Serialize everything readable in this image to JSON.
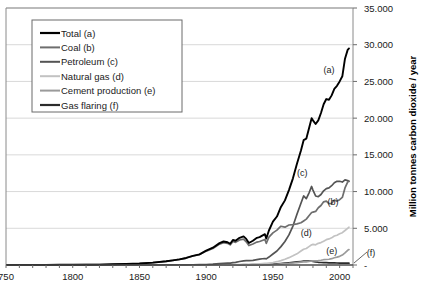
{
  "chart_data": {
    "type": "line",
    "title": "",
    "xlabel": "",
    "ylabel": "Million tonnes carbon dioxide / year",
    "xlim": [
      1750,
      2010
    ],
    "ylim": [
      0,
      35000
    ],
    "grid": true,
    "legend_position": "top-left",
    "x_ticks": [
      "750",
      "1800",
      "1850",
      "1900",
      "1950",
      "2000"
    ],
    "x_tick_values": [
      1750,
      1800,
      1850,
      1900,
      1950,
      2000
    ],
    "y_ticks": [
      "-",
      "5.000",
      "10.000",
      "15.000",
      "20.000",
      "25.000",
      "30.000",
      "35.000"
    ],
    "y_tick_values": [
      0,
      5000,
      10000,
      15000,
      20000,
      25000,
      30000,
      35000
    ],
    "annotations": [
      {
        "label": "(a)",
        "x": 1992,
        "y": 26200
      },
      {
        "label": "(c)",
        "x": 1972,
        "y": 12100
      },
      {
        "label": "(b)",
        "x": 1995,
        "y": 8200
      },
      {
        "label": "(d)",
        "x": 1975,
        "y": 3900
      },
      {
        "label": "(e)",
        "x": 1994,
        "y": 1450
      },
      {
        "label": "(f)",
        "x": 2014,
        "y": 1400
      }
    ],
    "x": [
      1751,
      1760,
      1770,
      1780,
      1790,
      1800,
      1810,
      1820,
      1830,
      1840,
      1850,
      1860,
      1870,
      1875,
      1880,
      1885,
      1890,
      1895,
      1900,
      1905,
      1910,
      1913,
      1916,
      1918,
      1920,
      1922,
      1925,
      1928,
      1930,
      1932,
      1935,
      1938,
      1940,
      1942,
      1944,
      1945,
      1947,
      1950,
      1953,
      1956,
      1959,
      1962,
      1965,
      1968,
      1971,
      1973,
      1975,
      1977,
      1979,
      1980,
      1982,
      1984,
      1986,
      1988,
      1990,
      1992,
      1994,
      1996,
      1998,
      2000,
      2002,
      2004,
      2006,
      2007
    ],
    "series": [
      {
        "name": "Total (a)",
        "key": "total",
        "color": "#000000",
        "width": 1.9,
        "values": [
          11,
          11,
          15,
          22,
          29,
          29,
          44,
          55,
          95,
          150,
          198,
          320,
          510,
          630,
          770,
          960,
          1250,
          1450,
          1950,
          2350,
          2980,
          3200,
          3100,
          2900,
          3400,
          3300,
          3700,
          3900,
          3550,
          3000,
          3300,
          3700,
          3800,
          4000,
          4200,
          3600,
          4700,
          5900,
          6600,
          7900,
          8800,
          10200,
          11800,
          13800,
          15600,
          17000,
          17200,
          18600,
          20000,
          19700,
          19200,
          19700,
          20700,
          21900,
          22600,
          22500,
          23100,
          24000,
          24400,
          25000,
          25700,
          28100,
          29300,
          29500
        ]
      },
      {
        "name": "Coal (b)",
        "key": "coal",
        "color": "#6e6e6e",
        "width": 1.7,
        "values": [
          11,
          11,
          15,
          22,
          29,
          29,
          44,
          55,
          95,
          150,
          198,
          320,
          505,
          620,
          760,
          945,
          1230,
          1420,
          1890,
          2260,
          2840,
          3050,
          2950,
          2740,
          3200,
          3080,
          3400,
          3520,
          3160,
          2650,
          2870,
          3120,
          3200,
          3340,
          3480,
          2950,
          3800,
          4380,
          4750,
          5280,
          5150,
          5450,
          5500,
          5600,
          5750,
          6000,
          6250,
          6700,
          7150,
          7200,
          7300,
          7800,
          8100,
          8600,
          8700,
          8350,
          8400,
          8850,
          8700,
          8900,
          9200,
          10500,
          11300,
          11400
        ]
      },
      {
        "name": "Petroleum (c)",
        "key": "petroleum",
        "color": "#545454",
        "width": 1.7,
        "values": [
          0,
          0,
          0,
          0,
          0,
          0,
          0,
          0,
          0,
          0,
          0,
          1,
          5,
          9,
          14,
          21,
          32,
          45,
          65,
          110,
          180,
          230,
          250,
          260,
          330,
          360,
          480,
          570,
          600,
          590,
          640,
          740,
          800,
          850,
          880,
          830,
          1080,
          1500,
          1900,
          2500,
          3200,
          4100,
          5300,
          6900,
          8400,
          9400,
          9050,
          9800,
          10700,
          10200,
          9400,
          9300,
          9600,
          10100,
          10400,
          10500,
          10800,
          11200,
          11400,
          11400,
          11300,
          11600,
          11500,
          11400
        ]
      },
      {
        "name": "Natural gas (d)",
        "key": "natural_gas",
        "color": "#c2c2c2",
        "width": 1.7,
        "values": [
          0,
          0,
          0,
          0,
          0,
          0,
          0,
          0,
          0,
          0,
          0,
          0,
          0,
          0,
          1,
          2,
          4,
          6,
          9,
          14,
          22,
          30,
          36,
          40,
          48,
          55,
          70,
          90,
          105,
          100,
          115,
          140,
          160,
          185,
          215,
          210,
          265,
          340,
          450,
          600,
          780,
          1000,
          1250,
          1520,
          1900,
          2150,
          2250,
          2500,
          2750,
          2800,
          2750,
          2950,
          3050,
          3250,
          3450,
          3550,
          3700,
          3950,
          4050,
          4250,
          4400,
          4700,
          5000,
          5150
        ]
      },
      {
        "name": "Cement production (e)",
        "key": "cement",
        "color": "#9a9a9a",
        "width": 1.7,
        "values": [
          0,
          0,
          0,
          0,
          0,
          0,
          0,
          0,
          0,
          0,
          0,
          0,
          0,
          0,
          0,
          1,
          2,
          3,
          5,
          8,
          14,
          18,
          18,
          16,
          22,
          26,
          34,
          44,
          45,
          36,
          42,
          56,
          58,
          55,
          48,
          36,
          62,
          80,
          105,
          140,
          175,
          215,
          270,
          330,
          390,
          430,
          430,
          480,
          540,
          550,
          560,
          600,
          650,
          720,
          750,
          780,
          860,
          990,
          1080,
          1180,
          1350,
          1650,
          2000,
          2100
        ]
      },
      {
        "name": "Gas flaring (f)",
        "key": "gas_flaring",
        "color": "#2b2b2b",
        "width": 1.7,
        "values": [
          0,
          0,
          0,
          0,
          0,
          0,
          0,
          0,
          0,
          0,
          0,
          0,
          0,
          0,
          0,
          0,
          0,
          0,
          0,
          0,
          2,
          4,
          6,
          8,
          12,
          16,
          22,
          30,
          36,
          34,
          40,
          50,
          56,
          62,
          70,
          66,
          86,
          110,
          150,
          200,
          250,
          300,
          360,
          420,
          480,
          520,
          540,
          540,
          520,
          490,
          420,
          370,
          340,
          320,
          310,
          300,
          290,
          280,
          270,
          260,
          250,
          250,
          250,
          250
        ]
      }
    ]
  },
  "legend": {
    "items": [
      {
        "label": "Total (a)",
        "color": "#000000",
        "width": 2.2
      },
      {
        "label": "Coal (b)",
        "color": "#6e6e6e",
        "width": 2.0
      },
      {
        "label": "Petroleum (c)",
        "color": "#545454",
        "width": 2.0
      },
      {
        "label": "Natural gas (d)",
        "color": "#c2c2c2",
        "width": 2.0
      },
      {
        "label": "Cement production (e)",
        "color": "#9a9a9a",
        "width": 2.0
      },
      {
        "label": "Gas flaring (f)",
        "color": "#2b2b2b",
        "width": 2.2
      }
    ]
  },
  "style": {
    "grid_color": "#d9d9d9",
    "axis_color": "#6b6b6b",
    "plot_border_color": "#8a8a8a",
    "background": "#ffffff"
  }
}
